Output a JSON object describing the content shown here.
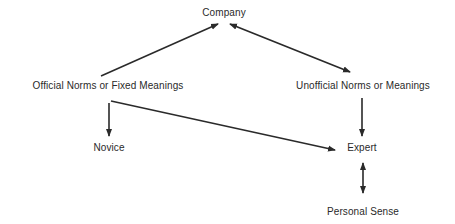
{
  "diagram": {
    "nodes": [
      {
        "id": "company",
        "label": "Company",
        "x": 224,
        "y": 7
      },
      {
        "id": "official",
        "label": "Official Norms or Fixed Meanings",
        "x": 108,
        "y": 80
      },
      {
        "id": "unofficial",
        "label": "Unofficial Norms or Meanings",
        "x": 363,
        "y": 80
      },
      {
        "id": "novice",
        "label": "Novice",
        "x": 109,
        "y": 142
      },
      {
        "id": "expert",
        "label": "Expert",
        "x": 362,
        "y": 142
      },
      {
        "id": "personal",
        "label": "Personal Sense",
        "x": 363,
        "y": 206
      }
    ],
    "edges": [
      {
        "from": "official",
        "to": "company",
        "type": "arrow"
      },
      {
        "from": "company",
        "to": "unofficial",
        "type": "double-arrow"
      },
      {
        "from": "official",
        "to": "novice",
        "type": "arrow"
      },
      {
        "from": "official",
        "to": "expert",
        "type": "arrow"
      },
      {
        "from": "unofficial",
        "to": "expert",
        "type": "arrow"
      },
      {
        "from": "expert",
        "to": "personal",
        "type": "double-arrow"
      }
    ],
    "colors": {
      "line": "#2a2a2a",
      "text": "#2a2a2a",
      "background": "#ffffff"
    }
  }
}
